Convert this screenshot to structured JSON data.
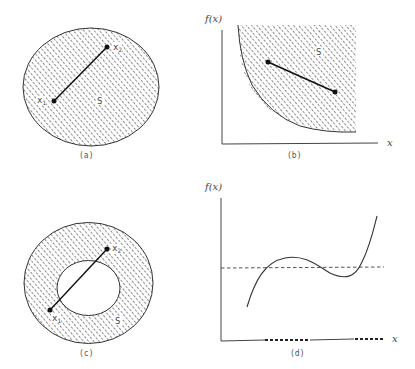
{
  "figure": {
    "panels": [
      {
        "id": "a",
        "caption": "(a)",
        "description": "Convex set S (ellipse) with segment joining two points",
        "points": [
          {
            "label": "x",
            "sub": "1"
          },
          {
            "label": "x",
            "sub": "2"
          }
        ],
        "set_label": "S"
      },
      {
        "id": "b",
        "caption": "(b)",
        "description": "Epigraph of convex function f(x), shaded region above curve",
        "y_axis_label": "f(x)",
        "x_axis_label": "x",
        "set_label": "S"
      },
      {
        "id": "c",
        "caption": "(c)",
        "description": "Nonconvex annular set S; segment between x1 and x2 passes through hole",
        "points": [
          {
            "label": "x",
            "sub": "1"
          },
          {
            "label": "x",
            "sub": "2"
          }
        ],
        "set_label": "S"
      },
      {
        "id": "d",
        "caption": "(d)",
        "description": "Nonconvex cubic-like function f(x) with dashed level line; level set on x axis shown dotted",
        "y_axis_label": "f(x)",
        "x_axis_label": "x"
      }
    ]
  },
  "colors": {
    "ink": "#222222",
    "hatch": "#555555",
    "background": "#ffffff"
  }
}
